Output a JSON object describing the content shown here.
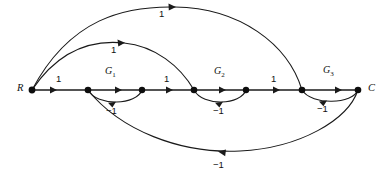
{
  "figure": {
    "type": "signal-flow-graph",
    "title": "",
    "background": "#ffffff",
    "stroke_color": "#1a1a1a",
    "width": 389,
    "height": 176
  },
  "nodes": [
    {
      "id": "R",
      "label": "R",
      "x": 32,
      "y": 90,
      "label_x": 18,
      "label_y": 84
    },
    {
      "id": "n1",
      "label": "",
      "x": 88,
      "y": 90
    },
    {
      "id": "n2",
      "label": "",
      "x": 142,
      "y": 90
    },
    {
      "id": "n3",
      "label": "",
      "x": 194,
      "y": 90
    },
    {
      "id": "n4",
      "label": "",
      "x": 246,
      "y": 90
    },
    {
      "id": "n5",
      "label": "",
      "x": 302,
      "y": 90
    },
    {
      "id": "C",
      "label": "C",
      "x": 358,
      "y": 90,
      "label_x": 368,
      "label_y": 84
    }
  ],
  "branch_labels": [
    {
      "name": "gain-r-n1",
      "text": "1",
      "x": 57,
      "y": 76
    },
    {
      "name": "gain-g1",
      "text": "G",
      "sub": "1",
      "x": 107,
      "y": 69
    },
    {
      "name": "gain-n2-n3",
      "text": "1",
      "x": 165,
      "y": 76
    },
    {
      "name": "gain-g2",
      "text": "G",
      "sub": "2",
      "x": 216,
      "y": 69
    },
    {
      "name": "gain-n4-n5",
      "text": "1",
      "x": 272,
      "y": 76
    },
    {
      "name": "gain-g3",
      "text": "G",
      "sub": "3",
      "x": 325,
      "y": 68
    },
    {
      "name": "gain-inner-arc",
      "text": "1",
      "x": 112,
      "y": 47
    },
    {
      "name": "gain-outer-arc",
      "text": "1",
      "x": 160,
      "y": 10
    },
    {
      "name": "gain-fb1",
      "text": "−1",
      "x": 112,
      "y": 104
    },
    {
      "name": "gain-fb2",
      "text": "−1",
      "x": 219,
      "y": 104
    },
    {
      "name": "gain-fb3",
      "text": "−1",
      "x": 322,
      "y": 102
    },
    {
      "name": "gain-outer-fb",
      "text": "−1",
      "x": 219,
      "y": 159
    }
  ],
  "edges": [
    {
      "name": "edge-r-n1",
      "kind": "forward",
      "from": "R",
      "to": "n1",
      "gain": "1"
    },
    {
      "name": "edge-n1-n2",
      "kind": "forward",
      "from": "n1",
      "to": "n2",
      "gain": "G1"
    },
    {
      "name": "edge-n2-n3",
      "kind": "forward",
      "from": "n2",
      "to": "n3",
      "gain": "1"
    },
    {
      "name": "edge-n3-n4",
      "kind": "forward",
      "from": "n3",
      "to": "n4",
      "gain": "G2"
    },
    {
      "name": "edge-n4-n5",
      "kind": "forward",
      "from": "n4",
      "to": "n5",
      "gain": "1"
    },
    {
      "name": "edge-n5-c",
      "kind": "forward",
      "from": "n5",
      "to": "C",
      "gain": "G3"
    },
    {
      "name": "edge-feedback-1",
      "kind": "feedback-loop",
      "from": "n2",
      "to": "n1",
      "gain": "-1"
    },
    {
      "name": "edge-feedback-2",
      "kind": "feedback-loop",
      "from": "n4",
      "to": "n3",
      "gain": "-1"
    },
    {
      "name": "edge-feedback-3",
      "kind": "feedback-loop",
      "from": "C",
      "to": "n5",
      "gain": "-1"
    },
    {
      "name": "edge-input-inner",
      "kind": "upper-arc",
      "from": "R",
      "to": "n3",
      "gain": "1"
    },
    {
      "name": "edge-input-outer",
      "kind": "upper-arc",
      "from": "R",
      "to": "n5",
      "gain": "1"
    },
    {
      "name": "edge-output-fb",
      "kind": "lower-arc",
      "from": "C",
      "to": "n1",
      "gain": "-1"
    }
  ]
}
